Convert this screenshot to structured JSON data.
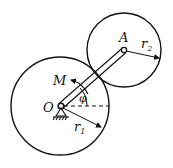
{
  "diagram": {
    "labels": {
      "A": "A",
      "O": "O",
      "M": "M",
      "phi": "φ",
      "r1": "r",
      "r1_sub": "1",
      "r2": "r",
      "r2_sub": "2"
    },
    "colors": {
      "stroke": "#111111",
      "background": "#ffffff"
    }
  }
}
